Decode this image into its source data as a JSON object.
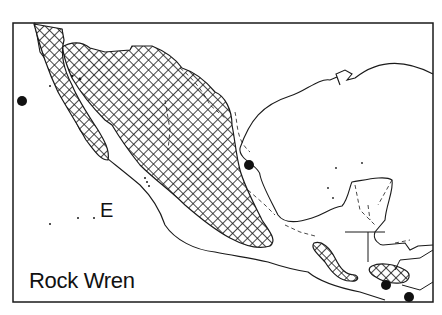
{
  "map": {
    "title": "Rock Wren",
    "region_label": "E",
    "legend": {
      "range_pattern": "crosshatch",
      "records": "solid-dot"
    },
    "colors": {
      "ink": "#1a1a1a",
      "background": "#ffffff"
    },
    "record_dots": [
      {
        "x": 22,
        "y": 101
      },
      {
        "x": 249,
        "y": 165
      },
      {
        "x": 386,
        "y": 285
      },
      {
        "x": 409,
        "y": 297
      }
    ]
  }
}
